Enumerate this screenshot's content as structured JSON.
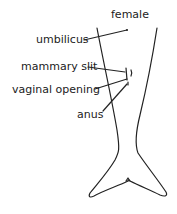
{
  "diagram": {
    "title": "female",
    "labels": {
      "umbilicus": "umbilicus",
      "mammary_slit": "mammary slit",
      "vaginal_opening": "vaginal opening",
      "anus": "anus"
    },
    "line_color": "#222222"
  }
}
